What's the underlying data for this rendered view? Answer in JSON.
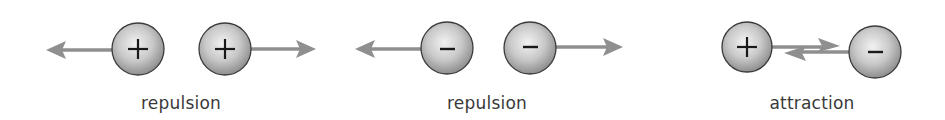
{
  "diagram": {
    "colors": {
      "arrow": "#8f8f8f",
      "sphere_light": "#eeeeee",
      "sphere_dark": "#9a9a9a",
      "sphere_stroke": "#3c3c3c",
      "sign": "#1a1a1a",
      "label": "#3a3a3a"
    },
    "groups": [
      {
        "id": "repulsion-positive",
        "label": "repulsion",
        "charges": [
          {
            "sign": "+",
            "symbol": "positive-charge"
          },
          {
            "sign": "+",
            "symbol": "positive-charge"
          }
        ],
        "arrows": [
          "outward-left",
          "outward-right"
        ]
      },
      {
        "id": "repulsion-negative",
        "label": "repulsion",
        "charges": [
          {
            "sign": "−",
            "symbol": "negative-charge"
          },
          {
            "sign": "−",
            "symbol": "negative-charge"
          }
        ],
        "arrows": [
          "outward-left",
          "outward-right"
        ]
      },
      {
        "id": "attraction",
        "label": "attraction",
        "charges": [
          {
            "sign": "+",
            "symbol": "positive-charge"
          },
          {
            "sign": "−",
            "symbol": "negative-charge"
          }
        ],
        "arrows": [
          "inward-right",
          "inward-left"
        ]
      }
    ]
  }
}
